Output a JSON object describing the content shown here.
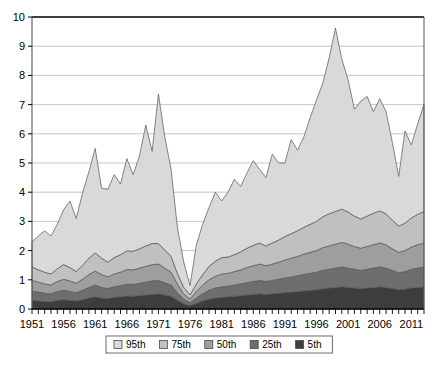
{
  "chart_data": {
    "type": "area",
    "stacked": true,
    "title": "",
    "subtitle": "",
    "xlabel": "",
    "ylabel": "",
    "xlim": [
      1951,
      2013
    ],
    "ylim": [
      0,
      10
    ],
    "yticks": [
      0,
      1,
      2,
      3,
      4,
      5,
      6,
      7,
      8,
      9,
      10
    ],
    "ytick_labels": [
      "0",
      "1",
      "2",
      "3",
      "4",
      "5",
      "6",
      "7",
      "8",
      "9",
      "10"
    ],
    "xticks": [
      1951,
      1956,
      1961,
      1966,
      1971,
      1976,
      1981,
      1986,
      1991,
      1996,
      2001,
      2006,
      2011
    ],
    "xtick_labels": [
      "1951",
      "1956",
      "1961",
      "1966",
      "1971",
      "1976",
      "1981",
      "1986",
      "1991",
      "1996",
      "2001",
      "2006",
      "2011"
    ],
    "minor_xtick_interval": 1,
    "grid": "horizontal",
    "legend_position": "bottom-center",
    "legend_entries": [
      "95th",
      "75th",
      "50th",
      "25th",
      "5th"
    ],
    "series_colors": {
      "95th": "#d9d9d9",
      "75th": "#c0c0c0",
      "50th": "#9e9e9e",
      "25th": "#6e6e6e",
      "5th": "#3d3d3d"
    },
    "x": [
      1951,
      1952,
      1953,
      1954,
      1955,
      1956,
      1957,
      1958,
      1959,
      1960,
      1961,
      1962,
      1963,
      1964,
      1965,
      1966,
      1967,
      1968,
      1969,
      1970,
      1971,
      1972,
      1973,
      1974,
      1975,
      1976,
      1977,
      1978,
      1979,
      1980,
      1981,
      1982,
      1983,
      1984,
      1985,
      1986,
      1987,
      1988,
      1989,
      1990,
      1991,
      1992,
      1993,
      1994,
      1995,
      1996,
      1997,
      1998,
      1999,
      2000,
      2001,
      2002,
      2003,
      2004,
      2005,
      2006,
      2007,
      2008,
      2009,
      2010,
      2011,
      2012,
      2013
    ],
    "series": [
      {
        "name": "5th",
        "values": [
          0.3,
          0.28,
          0.26,
          0.25,
          0.3,
          0.32,
          0.3,
          0.28,
          0.32,
          0.38,
          0.42,
          0.38,
          0.36,
          0.4,
          0.42,
          0.45,
          0.44,
          0.46,
          0.48,
          0.5,
          0.52,
          0.48,
          0.44,
          0.3,
          0.18,
          0.12,
          0.2,
          0.28,
          0.34,
          0.38,
          0.4,
          0.42,
          0.44,
          0.46,
          0.48,
          0.5,
          0.52,
          0.5,
          0.52,
          0.54,
          0.56,
          0.58,
          0.6,
          0.62,
          0.64,
          0.66,
          0.7,
          0.72,
          0.74,
          0.76,
          0.74,
          0.72,
          0.7,
          0.72,
          0.74,
          0.76,
          0.74,
          0.7,
          0.66,
          0.68,
          0.72,
          0.74,
          0.76
        ]
      },
      {
        "name": "25th",
        "values": [
          0.32,
          0.3,
          0.28,
          0.27,
          0.3,
          0.32,
          0.3,
          0.28,
          0.32,
          0.36,
          0.4,
          0.36,
          0.34,
          0.36,
          0.38,
          0.4,
          0.4,
          0.42,
          0.44,
          0.46,
          0.46,
          0.42,
          0.38,
          0.26,
          0.16,
          0.1,
          0.18,
          0.24,
          0.3,
          0.34,
          0.36,
          0.36,
          0.38,
          0.4,
          0.42,
          0.44,
          0.46,
          0.44,
          0.46,
          0.48,
          0.5,
          0.52,
          0.54,
          0.56,
          0.58,
          0.6,
          0.62,
          0.64,
          0.66,
          0.68,
          0.66,
          0.64,
          0.62,
          0.64,
          0.66,
          0.68,
          0.66,
          0.62,
          0.58,
          0.6,
          0.64,
          0.66,
          0.68
        ]
      },
      {
        "name": "50th",
        "values": [
          0.36,
          0.34,
          0.32,
          0.3,
          0.34,
          0.38,
          0.36,
          0.32,
          0.38,
          0.44,
          0.48,
          0.44,
          0.4,
          0.44,
          0.46,
          0.5,
          0.5,
          0.52,
          0.54,
          0.56,
          0.56,
          0.5,
          0.44,
          0.3,
          0.18,
          0.12,
          0.22,
          0.3,
          0.36,
          0.4,
          0.44,
          0.44,
          0.46,
          0.48,
          0.52,
          0.54,
          0.56,
          0.54,
          0.56,
          0.58,
          0.62,
          0.64,
          0.66,
          0.7,
          0.72,
          0.74,
          0.78,
          0.8,
          0.82,
          0.84,
          0.82,
          0.78,
          0.76,
          0.78,
          0.8,
          0.82,
          0.8,
          0.74,
          0.7,
          0.72,
          0.76,
          0.8,
          0.82
        ]
      },
      {
        "name": "75th",
        "values": [
          0.46,
          0.42,
          0.4,
          0.38,
          0.44,
          0.5,
          0.46,
          0.4,
          0.48,
          0.56,
          0.62,
          0.56,
          0.5,
          0.56,
          0.6,
          0.64,
          0.64,
          0.66,
          0.7,
          0.72,
          0.7,
          0.62,
          0.54,
          0.36,
          0.22,
          0.14,
          0.26,
          0.36,
          0.46,
          0.52,
          0.56,
          0.56,
          0.58,
          0.62,
          0.66,
          0.7,
          0.72,
          0.68,
          0.72,
          0.76,
          0.8,
          0.84,
          0.88,
          0.92,
          0.96,
          1.0,
          1.06,
          1.1,
          1.12,
          1.14,
          1.1,
          1.04,
          1.0,
          1.04,
          1.08,
          1.1,
          1.06,
          0.98,
          0.9,
          0.94,
          1.0,
          1.04,
          1.08
        ]
      },
      {
        "name": "95th",
        "values": [
          0.86,
          1.16,
          1.42,
          1.3,
          1.52,
          1.88,
          2.28,
          1.82,
          2.48,
          2.96,
          3.58,
          2.4,
          2.5,
          2.84,
          2.42,
          3.16,
          2.62,
          3.18,
          4.14,
          3.16,
          5.12,
          3.88,
          2.98,
          1.58,
          0.86,
          0.32,
          1.34,
          1.72,
          2.02,
          2.36,
          1.94,
          2.22,
          2.58,
          2.24,
          2.58,
          2.9,
          2.52,
          2.34,
          3.04,
          2.64,
          2.52,
          3.22,
          2.76,
          3.1,
          3.66,
          4.16,
          4.58,
          5.34,
          6.28,
          5.14,
          4.52,
          3.66,
          4.04,
          4.1,
          3.48,
          3.84,
          3.5,
          2.66,
          1.7,
          3.16,
          2.5,
          3.1,
          3.66
        ]
      }
    ],
    "totals": [
      2.3,
      2.5,
      2.68,
      2.5,
      2.9,
      3.4,
      3.7,
      3.1,
      4.0,
      4.7,
      5.5,
      4.1,
      4.1,
      4.6,
      4.28,
      5.15,
      4.6,
      5.24,
      6.3,
      5.4,
      7.36,
      5.9,
      4.78,
      2.8,
      1.6,
      0.8,
      2.2,
      2.9,
      3.48,
      4.0,
      3.7,
      4.0,
      4.44,
      4.2,
      4.66,
      5.08,
      4.78,
      4.5,
      5.3,
      5.0,
      5.0,
      5.8,
      5.44,
      5.9,
      6.56,
      7.16,
      7.74,
      8.6,
      9.62,
      8.56,
      7.84,
      6.84,
      7.12,
      7.28,
      6.76,
      7.2,
      6.76,
      5.7,
      4.54,
      6.1,
      5.62,
      6.34,
      7.0
    ]
  },
  "axis": {
    "y_axis_name": "value-axis",
    "x_axis_name": "year-axis"
  }
}
